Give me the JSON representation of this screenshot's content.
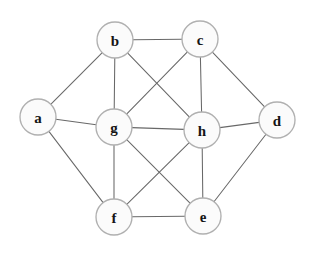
{
  "figure": {
    "background_color": "#ffffff",
    "node_fill_color": "#fbfbfb",
    "node_stroke_color": "#b0b0b0",
    "edge_color": "#686868",
    "label_color": "#151515",
    "node_radius": 18
  },
  "chart_data": {
    "type": "diagram",
    "graph_type": "undirected-graph",
    "title": "",
    "xlabel": "",
    "ylabel": "",
    "grid": false,
    "legend": "none",
    "node_count": 8,
    "edge_count": 17,
    "nodes": [
      {
        "id": "a",
        "label": "a",
        "x": 38,
        "y": 117
      },
      {
        "id": "b",
        "label": "b",
        "x": 115,
        "y": 40
      },
      {
        "id": "c",
        "label": "c",
        "x": 200,
        "y": 39
      },
      {
        "id": "d",
        "label": "d",
        "x": 277,
        "y": 120
      },
      {
        "id": "e",
        "label": "e",
        "x": 203,
        "y": 216
      },
      {
        "id": "f",
        "label": "f",
        "x": 114,
        "y": 217
      },
      {
        "id": "g",
        "label": "g",
        "x": 114,
        "y": 127
      },
      {
        "id": "h",
        "label": "h",
        "x": 202,
        "y": 130
      }
    ],
    "edges": [
      {
        "source": "a",
        "target": "b"
      },
      {
        "source": "a",
        "target": "g"
      },
      {
        "source": "a",
        "target": "f"
      },
      {
        "source": "b",
        "target": "c"
      },
      {
        "source": "b",
        "target": "g"
      },
      {
        "source": "b",
        "target": "h"
      },
      {
        "source": "c",
        "target": "g"
      },
      {
        "source": "c",
        "target": "h"
      },
      {
        "source": "c",
        "target": "d"
      },
      {
        "source": "d",
        "target": "h"
      },
      {
        "source": "d",
        "target": "e"
      },
      {
        "source": "g",
        "target": "h"
      },
      {
        "source": "g",
        "target": "f"
      },
      {
        "source": "g",
        "target": "e"
      },
      {
        "source": "h",
        "target": "f"
      },
      {
        "source": "h",
        "target": "e"
      },
      {
        "source": "f",
        "target": "e"
      }
    ],
    "degrees": {
      "a": 3,
      "b": 4,
      "c": 4,
      "d": 3,
      "e": 4,
      "f": 4,
      "g": 6,
      "h": 6
    }
  }
}
